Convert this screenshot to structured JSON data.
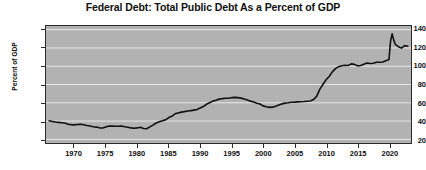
{
  "chart_data": {
    "type": "line",
    "title": "Federal Debt: Total Public Debt As a Percent of GDP",
    "xlabel": "",
    "ylabel": "Percent of GDP",
    "xlim": [
      1965.5,
      2023.5
    ],
    "ylim": [
      16,
      144
    ],
    "yticks": [
      20,
      40,
      60,
      80,
      100,
      120,
      140
    ],
    "xticks": [
      1970,
      1975,
      1980,
      1985,
      1990,
      1995,
      2000,
      2005,
      2010,
      2015,
      2020
    ],
    "grid": "horizontal",
    "legend": "none",
    "line_color": "#101010",
    "plot_background": "#b2b2b2",
    "page_background": "#ffffff",
    "series": [
      {
        "name": "Federal Debt: Total Public Debt As a Percent of GDP",
        "x": [
          1966.0,
          1966.5,
          1967.0,
          1967.5,
          1968.0,
          1968.5,
          1969.0,
          1969.5,
          1970.0,
          1970.5,
          1971.0,
          1971.5,
          1972.0,
          1972.5,
          1973.0,
          1973.5,
          1974.0,
          1974.5,
          1975.0,
          1975.5,
          1976.0,
          1976.5,
          1977.0,
          1977.5,
          1978.0,
          1978.5,
          1979.0,
          1979.5,
          1980.0,
          1980.5,
          1981.0,
          1981.5,
          1982.0,
          1982.5,
          1983.0,
          1983.5,
          1984.0,
          1984.5,
          1985.0,
          1985.5,
          1986.0,
          1986.5,
          1987.0,
          1987.5,
          1988.0,
          1988.5,
          1989.0,
          1989.5,
          1990.0,
          1990.5,
          1991.0,
          1991.5,
          1992.0,
          1992.5,
          1993.0,
          1993.5,
          1994.0,
          1994.5,
          1995.0,
          1995.5,
          1996.0,
          1996.5,
          1997.0,
          1997.5,
          1998.0,
          1998.5,
          1999.0,
          1999.5,
          2000.0,
          2000.5,
          2001.0,
          2001.5,
          2002.0,
          2002.5,
          2003.0,
          2003.5,
          2004.0,
          2004.5,
          2005.0,
          2005.5,
          2006.0,
          2006.5,
          2007.0,
          2007.5,
          2008.0,
          2008.5,
          2009.0,
          2009.5,
          2010.0,
          2010.5,
          2011.0,
          2011.5,
          2012.0,
          2012.5,
          2013.0,
          2013.5,
          2014.0,
          2014.5,
          2015.0,
          2015.5,
          2016.0,
          2016.5,
          2017.0,
          2017.5,
          2018.0,
          2018.5,
          2019.0,
          2019.5,
          2020.0,
          2020.25,
          2020.5,
          2020.75,
          2021.0,
          2021.5,
          2022.0,
          2022.5,
          2023.0
        ],
        "y": [
          40.3,
          39.6,
          38.9,
          38.6,
          38.2,
          37.8,
          36.6,
          36.1,
          35.8,
          36.3,
          36.5,
          36.0,
          35.2,
          34.6,
          33.8,
          33.4,
          32.6,
          32.4,
          33.6,
          34.6,
          34.5,
          34.3,
          34.4,
          34.6,
          33.8,
          33.3,
          32.5,
          32.1,
          32.5,
          33.2,
          31.8,
          31.6,
          33.6,
          35.5,
          37.9,
          39.2,
          40.3,
          41.3,
          43.8,
          45.2,
          47.9,
          48.9,
          49.8,
          50.3,
          51.0,
          51.4,
          52.0,
          52.6,
          54.4,
          55.9,
          58.4,
          60.0,
          61.8,
          62.8,
          64.0,
          64.5,
          64.9,
          65.0,
          65.6,
          65.9,
          65.6,
          65.1,
          64.2,
          63.0,
          61.8,
          60.8,
          59.6,
          58.7,
          56.6,
          55.6,
          55.0,
          55.2,
          56.3,
          57.6,
          58.8,
          59.6,
          60.0,
          60.5,
          60.7,
          61.0,
          61.2,
          61.4,
          61.7,
          62.0,
          63.5,
          67.0,
          74.6,
          80.0,
          85.2,
          88.8,
          93.8,
          97.4,
          99.5,
          100.6,
          101.0,
          100.8,
          102.6,
          102.0,
          100.4,
          100.8,
          102.2,
          103.5,
          103.0,
          103.3,
          104.4,
          104.3,
          104.7,
          106.0,
          107.3,
          127.5,
          135.4,
          128.8,
          124.0,
          121.3,
          119.8,
          122.5,
          121.9
        ]
      }
    ]
  },
  "axes": {
    "ytick_labels": [
      "140",
      "120",
      "100",
      "80",
      "60",
      "40",
      "20"
    ],
    "xtick_labels": [
      "1970",
      "1975",
      "1980",
      "1985",
      "1990",
      "1995",
      "2000",
      "2005",
      "2010",
      "2015",
      "2020"
    ]
  }
}
